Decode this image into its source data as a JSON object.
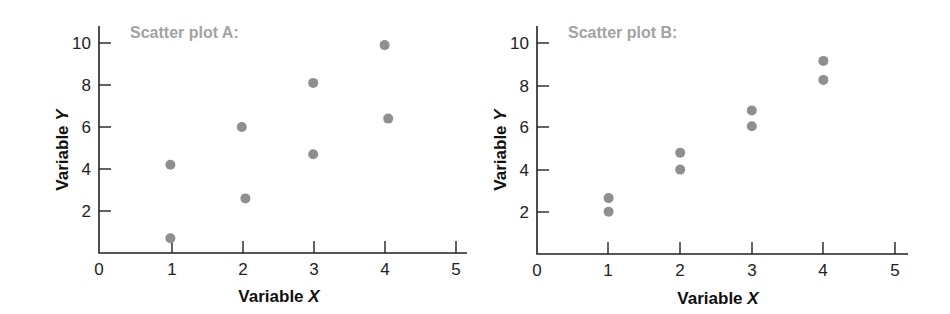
{
  "chart_data": [
    {
      "type": "scatter",
      "title": "Scatter plot A:",
      "xlabel": "Variable X",
      "ylabel": "Variable Y",
      "xlim": [
        0,
        5
      ],
      "ylim": [
        0,
        10
      ],
      "x_ticks": [
        0,
        1,
        2,
        3,
        4,
        5
      ],
      "y_ticks": [
        2,
        4,
        6,
        8,
        10
      ],
      "grid": false,
      "legend": null,
      "dot_color": "#8f8f8f",
      "title_color": "#a3a3a3",
      "points": [
        {
          "x": 1,
          "y": 0.7
        },
        {
          "x": 1,
          "y": 4.2
        },
        {
          "x": 2,
          "y": 6.0
        },
        {
          "x": 2.05,
          "y": 2.6
        },
        {
          "x": 3,
          "y": 8.1
        },
        {
          "x": 3,
          "y": 4.7
        },
        {
          "x": 4,
          "y": 9.9
        },
        {
          "x": 4.05,
          "y": 6.4
        }
      ]
    },
    {
      "type": "scatter",
      "title": "Scatter plot B:",
      "xlabel": "Variable X",
      "ylabel": "Variable Y",
      "xlim": [
        0,
        5
      ],
      "ylim": [
        0,
        10
      ],
      "x_ticks": [
        0,
        1,
        2,
        3,
        4,
        5
      ],
      "y_ticks": [
        2,
        4,
        6,
        8,
        10
      ],
      "grid": false,
      "legend": null,
      "dot_color": "#8f8f8f",
      "title_color": "#a3a3a3",
      "points": [
        {
          "x": 1,
          "y": 2.0
        },
        {
          "x": 1,
          "y": 2.65
        },
        {
          "x": 2,
          "y": 4.0
        },
        {
          "x": 2,
          "y": 4.8
        },
        {
          "x": 3,
          "y": 6.05
        },
        {
          "x": 3,
          "y": 6.8
        },
        {
          "x": 4,
          "y": 8.25
        },
        {
          "x": 4,
          "y": 9.15
        }
      ]
    }
  ],
  "plots": [
    {
      "title": "Scatter plot A:",
      "xlabel_prefix": "Variable ",
      "xlabel_var": "X",
      "ylabel_prefix": "Variable ",
      "ylabel_var": "Y",
      "x_tick_labels": [
        "0",
        "1",
        "2",
        "3",
        "4",
        "5"
      ],
      "y_tick_labels": [
        "2",
        "4",
        "6",
        "8",
        "10"
      ]
    },
    {
      "title": "Scatter plot B:",
      "xlabel_prefix": "Variable ",
      "xlabel_var": "X",
      "ylabel_prefix": "Variable ",
      "ylabel_var": "Y",
      "x_tick_labels": [
        "0",
        "1",
        "2",
        "3",
        "4",
        "5"
      ],
      "y_tick_labels": [
        "2",
        "4",
        "6",
        "8",
        "10"
      ]
    }
  ]
}
